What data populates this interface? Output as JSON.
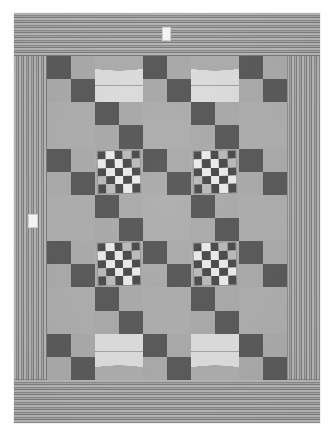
{
  "image": {
    "subject": "patchwork quilt",
    "background_color": "#ffffff"
  },
  "quilt": {
    "border": {
      "name": "striped-border",
      "stripe_light": "#b9b9b9",
      "stripe_dark": "#7f7f7f",
      "top_orientation": "horizontal",
      "bottom_orientation": "horizontal",
      "left_orientation": "vertical",
      "right_orientation": "vertical"
    },
    "field": {
      "columns": 5,
      "rows": 7,
      "background_color": "#a9a9a9"
    },
    "palette": {
      "dark": "#5c5c5c",
      "mid": "#adadad",
      "light": "#e0e0e0",
      "checker_light": "#ededed",
      "checker_dark": "#4e4e4e"
    },
    "blocks": [
      [
        "fourpatch",
        "scallop-top",
        "fourpatch",
        "scallop-top",
        "fourpatch"
      ],
      [
        "plain",
        "fourpatch",
        "plain",
        "fourpatch",
        "plain"
      ],
      [
        "fourpatch",
        "checker",
        "fourpatch",
        "checker",
        "fourpatch"
      ],
      [
        "plain",
        "fourpatch",
        "plain",
        "fourpatch",
        "plain"
      ],
      [
        "fourpatch",
        "checker",
        "fourpatch",
        "checker",
        "fourpatch"
      ],
      [
        "plain",
        "fourpatch",
        "plain",
        "fourpatch",
        "plain"
      ],
      [
        "fourpatch",
        "scallop-bottom",
        "fourpatch",
        "scallop-bottom",
        "fourpatch"
      ]
    ]
  },
  "markers": {
    "top_label": "",
    "left_label": ""
  }
}
